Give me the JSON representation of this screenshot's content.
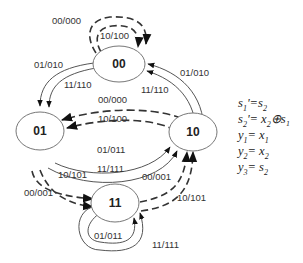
{
  "diagram": {
    "type": "state-diagram",
    "states": [
      {
        "id": "00",
        "label": "00"
      },
      {
        "id": "01",
        "label": "01"
      },
      {
        "id": "10",
        "label": "10"
      },
      {
        "id": "11",
        "label": "11"
      }
    ],
    "transitions": [
      {
        "from": "00",
        "to": "00",
        "label": "00/000",
        "style": "dashed"
      },
      {
        "from": "00",
        "to": "00",
        "label": "10/100",
        "style": "dashed"
      },
      {
        "from": "00",
        "to": "01",
        "label": "01/010",
        "style": "solid"
      },
      {
        "from": "00",
        "to": "01",
        "label": "11/110",
        "style": "solid"
      },
      {
        "from": "10",
        "to": "00",
        "label": "01/010",
        "style": "solid"
      },
      {
        "from": "10",
        "to": "00",
        "label": "11/110",
        "style": "solid"
      },
      {
        "from": "10",
        "to": "01",
        "label": "00/000",
        "style": "dashed"
      },
      {
        "from": "10",
        "to": "01",
        "label": "10/100",
        "style": "dashed"
      },
      {
        "from": "01",
        "to": "10",
        "label": "01/011",
        "style": "solid"
      },
      {
        "from": "01",
        "to": "10",
        "label": "11/111",
        "style": "solid"
      },
      {
        "from": "01",
        "to": "11",
        "label": "10/101",
        "style": "dashed"
      },
      {
        "from": "01",
        "to": "11",
        "label": "00/001",
        "style": "dashed"
      },
      {
        "from": "11",
        "to": "10",
        "label": "00/001",
        "style": "dashed"
      },
      {
        "from": "11",
        "to": "10",
        "label": "10/101",
        "style": "dashed"
      },
      {
        "from": "11",
        "to": "11",
        "label": "01/011",
        "style": "solid"
      },
      {
        "from": "11",
        "to": "11",
        "label": "11/111",
        "style": "solid"
      }
    ],
    "equations": [
      {
        "lhs": "s",
        "sub": "1",
        "prime": "'",
        "rhs": "=s",
        "rhs_sub": "2",
        "rhs_tail": ""
      },
      {
        "lhs": "s",
        "sub": "2",
        "prime": "'",
        "rhs": "= x",
        "rhs_sub": "2",
        "rhs_tail": "⊕s₁"
      },
      {
        "lhs": "y",
        "sub": "1",
        "prime": "",
        "rhs": "= x",
        "rhs_sub": "1",
        "rhs_tail": ""
      },
      {
        "lhs": "y",
        "sub": "2",
        "prime": "",
        "rhs": "= x",
        "rhs_sub": "2",
        "rhs_tail": ""
      },
      {
        "lhs": "y",
        "sub": "3",
        "prime": "",
        "rhs": "= s",
        "rhs_sub": "2",
        "rhs_tail": ""
      }
    ]
  }
}
